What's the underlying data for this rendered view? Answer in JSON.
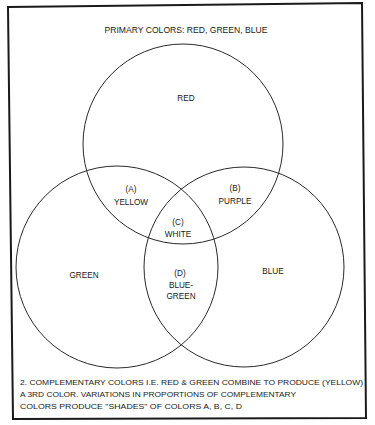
{
  "title": "PRIMARY COLORS: RED, GREEN, BLUE",
  "circles": [
    {
      "name": "RED",
      "cx": 183,
      "cy": 144,
      "r": 100
    },
    {
      "name": "GREEN",
      "cx": 117,
      "cy": 267,
      "r": 101
    },
    {
      "name": "BLUE",
      "cx": 244,
      "cy": 267,
      "r": 100
    }
  ],
  "labels": {
    "red": "RED",
    "green": "GREEN",
    "blue": "BLUE",
    "a_tag": "(A)",
    "a_name": "YELLOW",
    "b_tag": "(B)",
    "b_name": "PURPLE",
    "c_tag": "(C)",
    "c_name": "WHITE",
    "d_tag": "(D)",
    "d_name_1": "BLUE-",
    "d_name_2": "GREEN"
  },
  "footer": {
    "line1": "2. COMPLEMENTARY COLORS I.E. RED & GREEN COMBINE TO PRODUCE (YELLOW)",
    "line2": "A 3RD COLOR. VARIATIONS IN PROPORTIONS OF COMPLEMENTARY",
    "line3": "COLORS PRODUCE \"SHADES\" OF COLORS A, B, C, D"
  },
  "colors": {
    "line": "#2a2a2a",
    "text": "#1a1a1a",
    "background": "#ffffff"
  }
}
